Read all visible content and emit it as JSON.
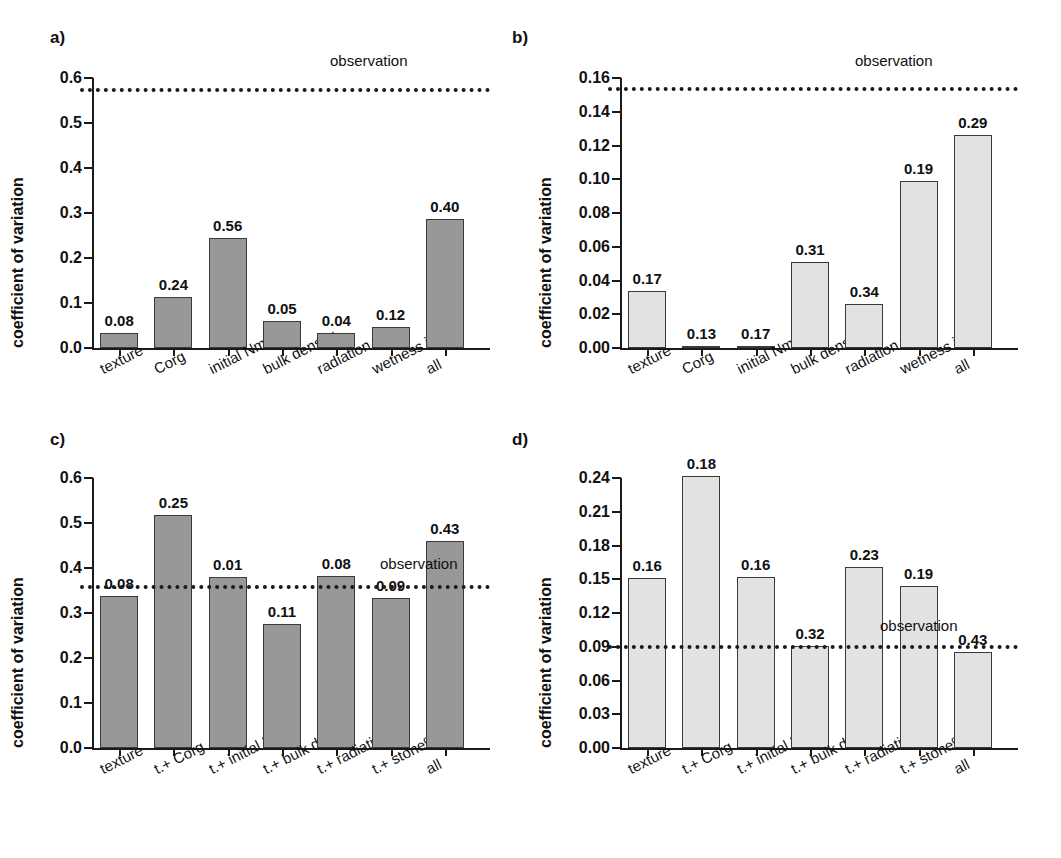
{
  "figure": {
    "panels": [
      "a)",
      "b)",
      "c)",
      "d)"
    ],
    "ylabel": "coefficient of variation",
    "observation_label": "observation"
  },
  "chart_data": [
    {
      "id": "a",
      "panel_letter": "a)",
      "type": "bar",
      "title": "",
      "xlabel": "",
      "ylabel": "coefficient of variation",
      "ylim": [
        0.0,
        0.6
      ],
      "yticks": [
        "0.0",
        "0.1",
        "0.2",
        "0.3",
        "0.4",
        "0.5",
        "0.6"
      ],
      "ytick_values": [
        0.0,
        0.1,
        0.2,
        0.3,
        0.4,
        0.5,
        0.6
      ],
      "grid": false,
      "bar_color": "#989898",
      "categories": [
        "texture",
        "Corg",
        "initial Nmin",
        "bulk density",
        "radiation",
        "wetness index",
        "all"
      ],
      "values": [
        0.033,
        0.114,
        0.244,
        0.06,
        0.034,
        0.047,
        0.287
      ],
      "data_labels": [
        "0.08",
        "0.24",
        "0.56",
        "0.05",
        "0.04",
        "0.12",
        "0.40"
      ],
      "observation": 0.578,
      "observation_label": "observation"
    },
    {
      "id": "b",
      "panel_letter": "b)",
      "type": "bar",
      "title": "",
      "xlabel": "",
      "ylabel": "coefficient of variation",
      "ylim": [
        0.0,
        0.16
      ],
      "yticks": [
        "0.00",
        "0.02",
        "0.04",
        "0.06",
        "0.08",
        "0.10",
        "0.12",
        "0.14",
        "0.16"
      ],
      "ytick_values": [
        0.0,
        0.02,
        0.04,
        0.06,
        0.08,
        0.1,
        0.12,
        0.14,
        0.16
      ],
      "grid": false,
      "bar_color": "#e2e2e2",
      "categories": [
        "texture",
        "Corg",
        "initial Nmin",
        "bulk density",
        "radiation",
        "wetness index",
        "all"
      ],
      "values": [
        0.0335,
        0.0012,
        0.0012,
        0.0508,
        0.0262,
        0.0988,
        0.1265
      ],
      "data_labels": [
        "0.17",
        "0.13",
        "0.17",
        "0.31",
        "0.34",
        "0.19",
        "0.29"
      ],
      "observation": 0.1548,
      "observation_label": "observation"
    },
    {
      "id": "c",
      "panel_letter": "c)",
      "type": "bar",
      "title": "",
      "xlabel": "",
      "ylabel": "coefficient of variation",
      "ylim": [
        0.0,
        0.6
      ],
      "yticks": [
        "0.0",
        "0.1",
        "0.2",
        "0.3",
        "0.4",
        "0.5",
        "0.6"
      ],
      "ytick_values": [
        0.0,
        0.1,
        0.2,
        0.3,
        0.4,
        0.5,
        0.6
      ],
      "grid": false,
      "bar_color": "#989898",
      "categories": [
        "texture",
        "t.+ Corg",
        "t.+ initial Nmin",
        "t.+ bulk density",
        "t.+ radiation",
        "t.+ stone%",
        "all"
      ],
      "values": [
        0.338,
        0.518,
        0.381,
        0.275,
        0.382,
        0.333,
        0.459
      ],
      "data_labels": [
        "0.08",
        "0.25",
        "0.01",
        "0.11",
        "0.08",
        "0.09",
        "0.43"
      ],
      "observation": 0.363,
      "observation_label": "observation"
    },
    {
      "id": "d",
      "panel_letter": "d)",
      "type": "bar",
      "title": "",
      "xlabel": "",
      "ylabel": "coefficient of variation",
      "ylim": [
        0.0,
        0.24
      ],
      "yticks": [
        "0.00",
        "0.03",
        "0.06",
        "0.09",
        "0.12",
        "0.15",
        "0.18",
        "0.21",
        "0.24"
      ],
      "ytick_values": [
        0.0,
        0.03,
        0.06,
        0.09,
        0.12,
        0.15,
        0.18,
        0.21,
        0.24
      ],
      "grid": false,
      "bar_color": "#e2e2e2",
      "categories": [
        "texture",
        "t.+ Corg",
        "t.+ initial Nmin",
        "t.+ bulk density",
        "t.+ radiation",
        "t.+ stone%",
        "all"
      ],
      "values": [
        0.1512,
        0.2418,
        0.1516,
        0.0905,
        0.1607,
        0.144,
        0.0855
      ],
      "data_labels": [
        "0.16",
        "0.18",
        "0.16",
        "0.32",
        "0.23",
        "0.19",
        "0.43"
      ],
      "observation": 0.0918,
      "observation_label": "observation"
    }
  ]
}
